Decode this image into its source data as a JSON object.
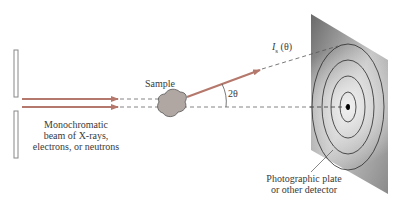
{
  "diagram": {
    "labels": {
      "sample": "Sample",
      "beam_line1": "Monochromatic",
      "beam_line2": "beam of X-rays,",
      "beam_line3": "electrons, or neutrons",
      "intensity": "I",
      "intensity_sub": "s",
      "intensity_arg": " (θ)",
      "angle": "2θ",
      "detector_line1": "Photographic plate",
      "detector_line2": "or other detector"
    },
    "colors": {
      "beam": "#b5786c",
      "sample_fill": "#b0a7a2",
      "plate_dark": "#6d6d6d",
      "plate_light": "#e6e6e6",
      "ring": "#2a2a2a",
      "dashed": "#666666",
      "slit": "#888888"
    },
    "rings": 4
  }
}
